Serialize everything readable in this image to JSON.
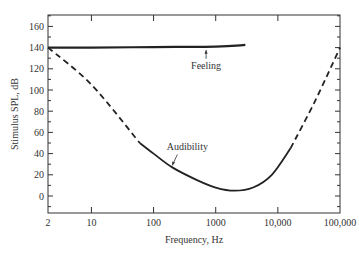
{
  "chart_data": {
    "type": "line",
    "title": "",
    "xlabel": "Frequency, Hz",
    "ylabel": "Stimulus SPL, dB",
    "xscale": "log",
    "xlim": [
      2,
      100000
    ],
    "ylim": [
      -13,
      170
    ],
    "grid": false,
    "legend": "none",
    "x_tick_labels": [
      "2",
      "10",
      "100",
      "1000",
      "10,000",
      "100,000"
    ],
    "x_tick_values": [
      2,
      10,
      100,
      1000,
      10000,
      100000
    ],
    "y_tick_labels": [
      "0",
      "20",
      "40",
      "60",
      "80",
      "100",
      "120",
      "140",
      "160"
    ],
    "y_tick_values": [
      0,
      20,
      40,
      60,
      80,
      100,
      120,
      140,
      160
    ],
    "series": [
      {
        "name": "Feeling",
        "style": "solid",
        "x": [
          2,
          10,
          100,
          1000,
          3000
        ],
        "y": [
          140,
          140,
          140.5,
          141,
          142.5
        ]
      },
      {
        "name": "Audibility (extrapolated, low)",
        "style": "dashed",
        "x": [
          2,
          10,
          60
        ],
        "y": [
          140,
          105,
          50
        ]
      },
      {
        "name": "Audibility",
        "style": "solid",
        "x": [
          60,
          100,
          200,
          500,
          1000,
          2000,
          4000,
          8000,
          16000
        ],
        "y": [
          50,
          40,
          27,
          15,
          8,
          5,
          8,
          20,
          45
        ]
      },
      {
        "name": "Audibility (extrapolated, high)",
        "style": "dashed",
        "x": [
          16000,
          40000,
          100000
        ],
        "y": [
          45,
          90,
          140
        ]
      }
    ],
    "annotations": [
      {
        "text": "Feeling",
        "x": 700,
        "y": 120,
        "arrow_to": {
          "x": 700,
          "y": 140.5
        }
      },
      {
        "text": "Audibility",
        "x": 350,
        "y": 43,
        "arrow_to": {
          "x": 200,
          "y": 27
        }
      }
    ]
  }
}
